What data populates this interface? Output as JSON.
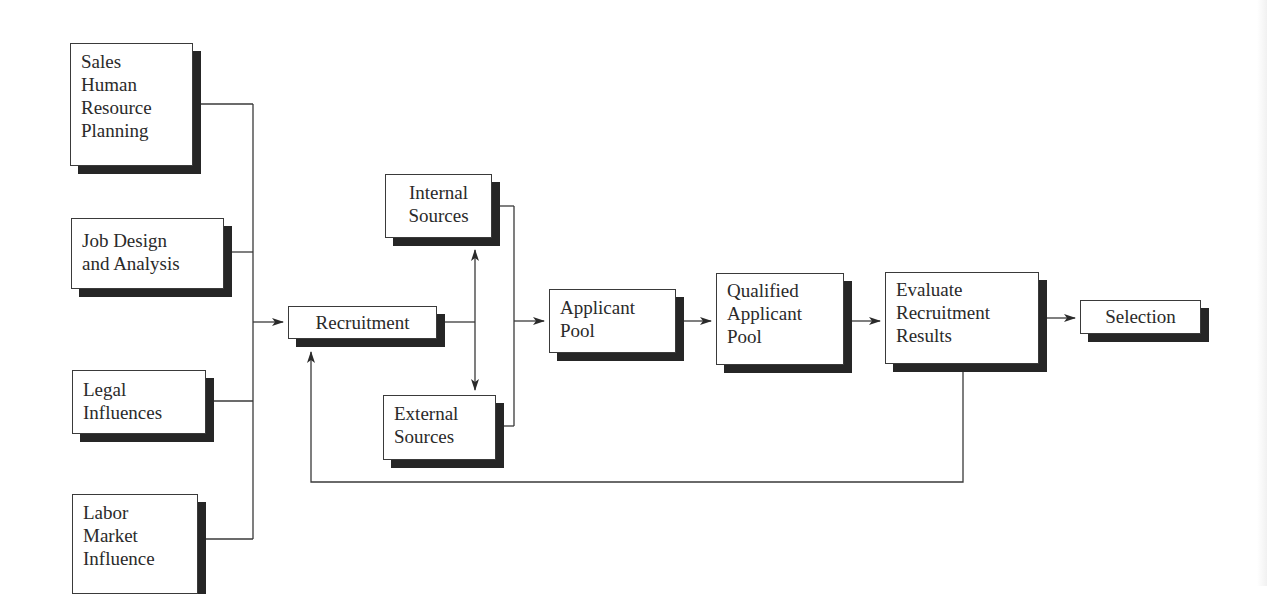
{
  "diagram": {
    "type": "flowchart",
    "title": "",
    "colors": {
      "line": "#3a3a3a",
      "shadow": "#262626",
      "box_fill": "#ffffff",
      "text": "#2a2a2a"
    },
    "inputs": [
      {
        "id": "sales_hrp",
        "lines": [
          "Sales",
          "Human",
          "Resource",
          "Planning"
        ]
      },
      {
        "id": "job_design",
        "lines": [
          "Job Design",
          "and Analysis"
        ]
      },
      {
        "id": "legal",
        "lines": [
          "Legal",
          "Influences"
        ]
      },
      {
        "id": "labor_market",
        "lines": [
          "Labor",
          "Market",
          "Influence"
        ]
      }
    ],
    "recruitment": {
      "lines": [
        "Recruitment"
      ]
    },
    "sources": {
      "internal": {
        "lines": [
          "Internal",
          "Sources"
        ]
      },
      "external": {
        "lines": [
          "External",
          "Sources"
        ]
      }
    },
    "pipeline": [
      {
        "id": "applicant_pool",
        "lines": [
          "Applicant",
          "Pool"
        ]
      },
      {
        "id": "qualified_pool",
        "lines": [
          "Qualified",
          "Applicant",
          "Pool"
        ]
      },
      {
        "id": "evaluate",
        "lines": [
          "Evaluate",
          "Recruitment",
          "Results"
        ]
      },
      {
        "id": "selection",
        "lines": [
          "Selection"
        ]
      }
    ],
    "edges": [
      {
        "from": "inputs",
        "to": "recruitment"
      },
      {
        "from": "recruitment",
        "to": "internal_sources",
        "bidirectional": true
      },
      {
        "from": "recruitment",
        "to": "external_sources",
        "bidirectional": true
      },
      {
        "from": "sources",
        "to": "applicant_pool"
      },
      {
        "from": "applicant_pool",
        "to": "qualified_pool"
      },
      {
        "from": "qualified_pool",
        "to": "evaluate"
      },
      {
        "from": "evaluate",
        "to": "selection"
      },
      {
        "from": "evaluate",
        "to": "recruitment",
        "label": "feedback"
      }
    ]
  }
}
